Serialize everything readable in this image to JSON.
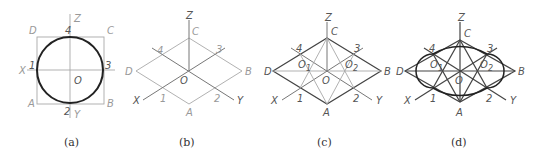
{
  "figure": {
    "panels": [
      {
        "id": "a",
        "caption": "(a)",
        "labels": {
          "Z": "Z",
          "X": "X",
          "Y": "Y",
          "O": "O",
          "A": "A",
          "B": "B",
          "C": "C",
          "D": "D",
          "p1": "1",
          "p2": "2",
          "p3": "3",
          "p4": "4"
        }
      },
      {
        "id": "b",
        "caption": "(b)",
        "labels": {
          "Z": "Z",
          "X": "X",
          "Y": "Y",
          "O": "O",
          "A": "A",
          "B": "B",
          "C": "C",
          "D": "D",
          "p1": "1",
          "p2": "2",
          "p3": "3",
          "p4": "4"
        }
      },
      {
        "id": "c",
        "caption": "(c)",
        "labels": {
          "Z": "Z",
          "X": "X",
          "Y": "Y",
          "O": "O",
          "O1": "O",
          "O1sub": "1",
          "O2": "O",
          "O2sub": "2",
          "A": "A",
          "B": "B",
          "C": "C",
          "D": "D",
          "p1": "1",
          "p2": "2",
          "p3": "3",
          "p4": "4"
        }
      },
      {
        "id": "d",
        "caption": "(d)",
        "labels": {
          "Z": "Z",
          "X": "X",
          "Y": "Y",
          "O": "O",
          "O1": "O",
          "O1sub": "1",
          "O2": "O",
          "O2sub": "2",
          "A": "A",
          "B": "B",
          "C": "C",
          "D": "D",
          "p1": "1",
          "p2": "2",
          "p3": "3",
          "p4": "4"
        }
      }
    ]
  }
}
